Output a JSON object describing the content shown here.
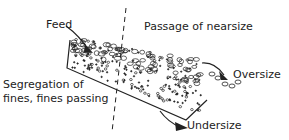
{
  "diagram": {
    "title": "",
    "labels": {
      "feed": "Feed",
      "nearsize": "Passage of nearsize",
      "oversize": "Oversize",
      "segregation_line1": "Segregation of",
      "segregation_line2": "fines, fines passing",
      "undersize": "Undersize"
    },
    "colors": {
      "ink": "#222222",
      "background": "#ffffff"
    }
  }
}
